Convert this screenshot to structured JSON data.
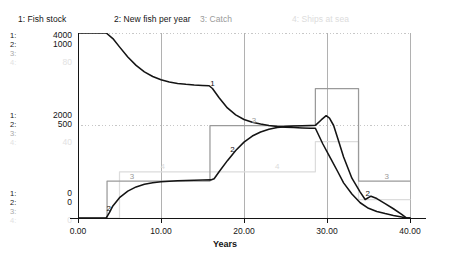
{
  "legend": {
    "items": [
      {
        "label": "1: Fish stock",
        "color": "#141414"
      },
      {
        "label": "2: New fish per year",
        "color": "#141414"
      },
      {
        "label": "3: Catch",
        "color": "#9a9a9a"
      },
      {
        "label": "4: Ships at sea",
        "color": "#dcdcdc"
      }
    ]
  },
  "axes": {
    "y_groups": [
      {
        "position": "top",
        "rows": [
          {
            "index": "1:",
            "value": "4000"
          },
          {
            "index": "2:",
            "value": "1000"
          },
          {
            "index": "3:",
            "value": ""
          },
          {
            "index": "4:",
            "value": "80"
          }
        ]
      },
      {
        "position": "middle",
        "rows": [
          {
            "index": "1:",
            "value": "2000"
          },
          {
            "index": "2:",
            "value": "500"
          },
          {
            "index": "3:",
            "value": ""
          },
          {
            "index": "4:",
            "value": "40"
          }
        ]
      },
      {
        "position": "bottom",
        "rows": [
          {
            "index": "1:",
            "value": "0"
          },
          {
            "index": "2:",
            "value": "0"
          },
          {
            "index": "3:",
            "value": ""
          },
          {
            "index": "4:",
            "value": "0"
          }
        ]
      }
    ],
    "x_title": "Years",
    "x_ticks": [
      "0.00",
      "10.00",
      "20.00",
      "30.00",
      "40.00"
    ]
  },
  "series_markers": [
    {
      "id": "1",
      "label": "1"
    },
    {
      "id": "1b",
      "label": "1"
    },
    {
      "id": "2",
      "label": "2"
    },
    {
      "id": "2b",
      "label": "2"
    },
    {
      "id": "2c",
      "label": "2"
    },
    {
      "id": "3",
      "label": "3"
    },
    {
      "id": "3b",
      "label": "3"
    },
    {
      "id": "3c",
      "label": "3"
    },
    {
      "id": "4",
      "label": "4"
    },
    {
      "id": "4b",
      "label": "4"
    }
  ],
  "chart_data": {
    "type": "line",
    "title": "",
    "subtitle": "",
    "xlabel": "Years",
    "ylabel": "",
    "xlim": [
      0,
      40
    ],
    "grid": true,
    "legend_position": "top",
    "x_ticks": [
      0,
      10,
      20,
      30,
      40
    ],
    "x_tick_labels": [
      "0.00",
      "10.00",
      "20.00",
      "30.00",
      "40.00"
    ],
    "series": [
      {
        "name": "Fish stock",
        "index": 1,
        "color": "#141414",
        "ylim": [
          0,
          4000
        ],
        "y_ticks": [
          0,
          2000,
          4000
        ],
        "y_tick_labels": [
          "0",
          "2000",
          "4000"
        ],
        "points": [
          [
            0.0,
            4000
          ],
          [
            2.0,
            4000
          ],
          [
            3.4,
            4000
          ],
          [
            4.2,
            3880
          ],
          [
            5.0,
            3700
          ],
          [
            6.0,
            3480
          ],
          [
            7.0,
            3300
          ],
          [
            8.0,
            3160
          ],
          [
            9.0,
            3060
          ],
          [
            10.0,
            2990
          ],
          [
            11.0,
            2940
          ],
          [
            12.0,
            2910
          ],
          [
            13.0,
            2890
          ],
          [
            14.0,
            2875
          ],
          [
            15.0,
            2865
          ],
          [
            15.8,
            2860
          ],
          [
            16.2,
            2800
          ],
          [
            17.0,
            2600
          ],
          [
            18.0,
            2380
          ],
          [
            19.0,
            2230
          ],
          [
            20.0,
            2130
          ],
          [
            21.0,
            2070
          ],
          [
            22.0,
            2030
          ],
          [
            23.0,
            2000
          ],
          [
            24.0,
            1980
          ],
          [
            25.0,
            1965
          ],
          [
            26.0,
            1955
          ],
          [
            27.0,
            1948
          ],
          [
            28.0,
            1942
          ],
          [
            28.6,
            1940
          ],
          [
            29.5,
            1600
          ],
          [
            30.5,
            1270
          ],
          [
            31.3,
            1000
          ],
          [
            32.0,
            760
          ],
          [
            33.0,
            520
          ],
          [
            34.0,
            330
          ],
          [
            35.0,
            210
          ],
          [
            36.0,
            140
          ],
          [
            37.0,
            95
          ],
          [
            38.0,
            55
          ],
          [
            39.0,
            20
          ],
          [
            39.6,
            0
          ],
          [
            40.0,
            0
          ]
        ]
      },
      {
        "name": "New fish per year",
        "index": 2,
        "color": "#141414",
        "ylim": [
          0,
          1000
        ],
        "y_ticks": [
          0,
          500,
          1000
        ],
        "y_tick_labels": [
          "0",
          "500",
          "1000"
        ],
        "points": [
          [
            0.0,
            0
          ],
          [
            3.4,
            0
          ],
          [
            3.8,
            30
          ],
          [
            4.2,
            65
          ],
          [
            5.0,
            110
          ],
          [
            6.0,
            145
          ],
          [
            7.0,
            168
          ],
          [
            8.0,
            182
          ],
          [
            9.0,
            190
          ],
          [
            10.0,
            196
          ],
          [
            11.0,
            199
          ],
          [
            12.0,
            201
          ],
          [
            13.0,
            203
          ],
          [
            14.0,
            204
          ],
          [
            15.0,
            205
          ],
          [
            16.0,
            206
          ],
          [
            16.4,
            212
          ],
          [
            17.0,
            250
          ],
          [
            18.0,
            310
          ],
          [
            19.0,
            365
          ],
          [
            20.0,
            410
          ],
          [
            21.0,
            443
          ],
          [
            22.0,
            465
          ],
          [
            23.0,
            480
          ],
          [
            24.0,
            489
          ],
          [
            25.0,
            494
          ],
          [
            26.0,
            497
          ],
          [
            27.0,
            499
          ],
          [
            28.0,
            500
          ],
          [
            28.6,
            501
          ],
          [
            29.3,
            530
          ],
          [
            29.9,
            553
          ],
          [
            30.3,
            540
          ],
          [
            30.8,
            500
          ],
          [
            31.3,
            430
          ],
          [
            32.0,
            330
          ],
          [
            33.0,
            215
          ],
          [
            34.0,
            140
          ],
          [
            34.6,
            100
          ],
          [
            35.3,
            118
          ],
          [
            36.0,
            105
          ],
          [
            37.0,
            78
          ],
          [
            38.0,
            50
          ],
          [
            39.0,
            20
          ],
          [
            39.6,
            0
          ],
          [
            40.0,
            0
          ]
        ]
      },
      {
        "name": "Catch",
        "index": 3,
        "color": "#9a9a9a",
        "ylim": [
          0,
          1000
        ],
        "y_ticks": [
          0,
          500,
          1000
        ],
        "y_tick_labels": [
          "0",
          "500",
          "1000"
        ],
        "step": true,
        "points": [
          [
            0.0,
            0
          ],
          [
            3.5,
            0
          ],
          [
            3.5,
            200
          ],
          [
            15.9,
            200
          ],
          [
            15.9,
            500
          ],
          [
            28.6,
            500
          ],
          [
            28.6,
            700
          ],
          [
            33.8,
            700
          ],
          [
            33.8,
            200
          ],
          [
            40.0,
            200
          ]
        ]
      },
      {
        "name": "Ships at sea",
        "index": 4,
        "color": "#dcdcdc",
        "ylim": [
          0,
          80
        ],
        "y_ticks": [
          0,
          40,
          80
        ],
        "y_tick_labels": [
          "0",
          "40",
          "80"
        ],
        "step": true,
        "points": [
          [
            0.0,
            0
          ],
          [
            5.0,
            0
          ],
          [
            5.0,
            20
          ],
          [
            15.9,
            20
          ],
          [
            15.9,
            20
          ],
          [
            28.6,
            20
          ],
          [
            28.6,
            33
          ],
          [
            33.8,
            33
          ],
          [
            33.8,
            8
          ],
          [
            40.0,
            8
          ]
        ]
      }
    ],
    "annotations": [
      {
        "text": "1",
        "x": 1.2,
        "series": 1
      },
      {
        "text": "1",
        "x": 16.2,
        "series": 1
      },
      {
        "text": "2",
        "x": 3.7,
        "series": 2
      },
      {
        "text": "2",
        "x": 18.6,
        "series": 2
      },
      {
        "text": "2",
        "x": 34.9,
        "series": 2
      },
      {
        "text": "3",
        "x": 6.5,
        "series": 3
      },
      {
        "text": "3",
        "x": 21.2,
        "series": 3
      },
      {
        "text": "3",
        "x": 37.2,
        "series": 3
      },
      {
        "text": "4",
        "x": 10.2,
        "series": 4
      },
      {
        "text": "4",
        "x": 24.0,
        "series": 4
      }
    ]
  }
}
